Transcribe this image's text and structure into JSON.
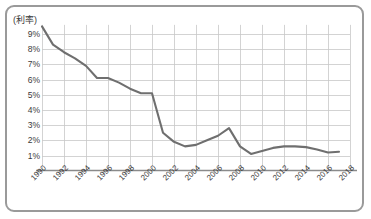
{
  "chart_data": {
    "type": "line",
    "title": "",
    "subtitle": "",
    "xlabel": "",
    "ylabel": "(利率)",
    "ylabel_note": "interest rate",
    "xlim": [
      1990,
      2018
    ],
    "ylim": [
      0,
      9.6
    ],
    "y_tick_labels": [
      "9%",
      "8%",
      "7%",
      "6%",
      "5%",
      "4%",
      "3%",
      "2%",
      "1%"
    ],
    "y_tick_values": [
      9,
      8,
      7,
      6,
      5,
      4,
      3,
      2,
      1
    ],
    "x_tick_labels": [
      "1990",
      "1992",
      "1994",
      "1996",
      "1998",
      "2000",
      "2002",
      "2004",
      "2006",
      "2008",
      "2010",
      "2012",
      "2014",
      "2016",
      "2018"
    ],
    "x_tick_values": [
      1990,
      1992,
      1994,
      1996,
      1998,
      2000,
      2002,
      2004,
      2006,
      2008,
      2010,
      2012,
      2014,
      2016,
      2018
    ],
    "grid": true,
    "legend": false,
    "legend_position": "none",
    "line_color": "#6f6f6f",
    "grid_color": "#c8c8c8",
    "axis_color": "#8a8a8a",
    "series": [
      {
        "name": "利率",
        "x": [
          1990,
          1991,
          1992,
          1993,
          1994,
          1995,
          1996,
          1997,
          1998,
          1999,
          2000,
          2001,
          2002,
          2003,
          2004,
          2005,
          2006,
          2007,
          2008,
          2009,
          2010,
          2011,
          2012,
          2013,
          2014,
          2015,
          2016,
          2017
        ],
        "values": [
          9.5,
          8.3,
          7.8,
          7.4,
          6.9,
          6.1,
          6.1,
          5.8,
          5.4,
          5.1,
          5.1,
          2.5,
          1.9,
          1.6,
          1.7,
          2.0,
          2.3,
          2.8,
          1.6,
          1.1,
          1.3,
          1.5,
          1.6,
          1.6,
          1.55,
          1.4,
          1.2,
          1.25
        ]
      }
    ]
  }
}
